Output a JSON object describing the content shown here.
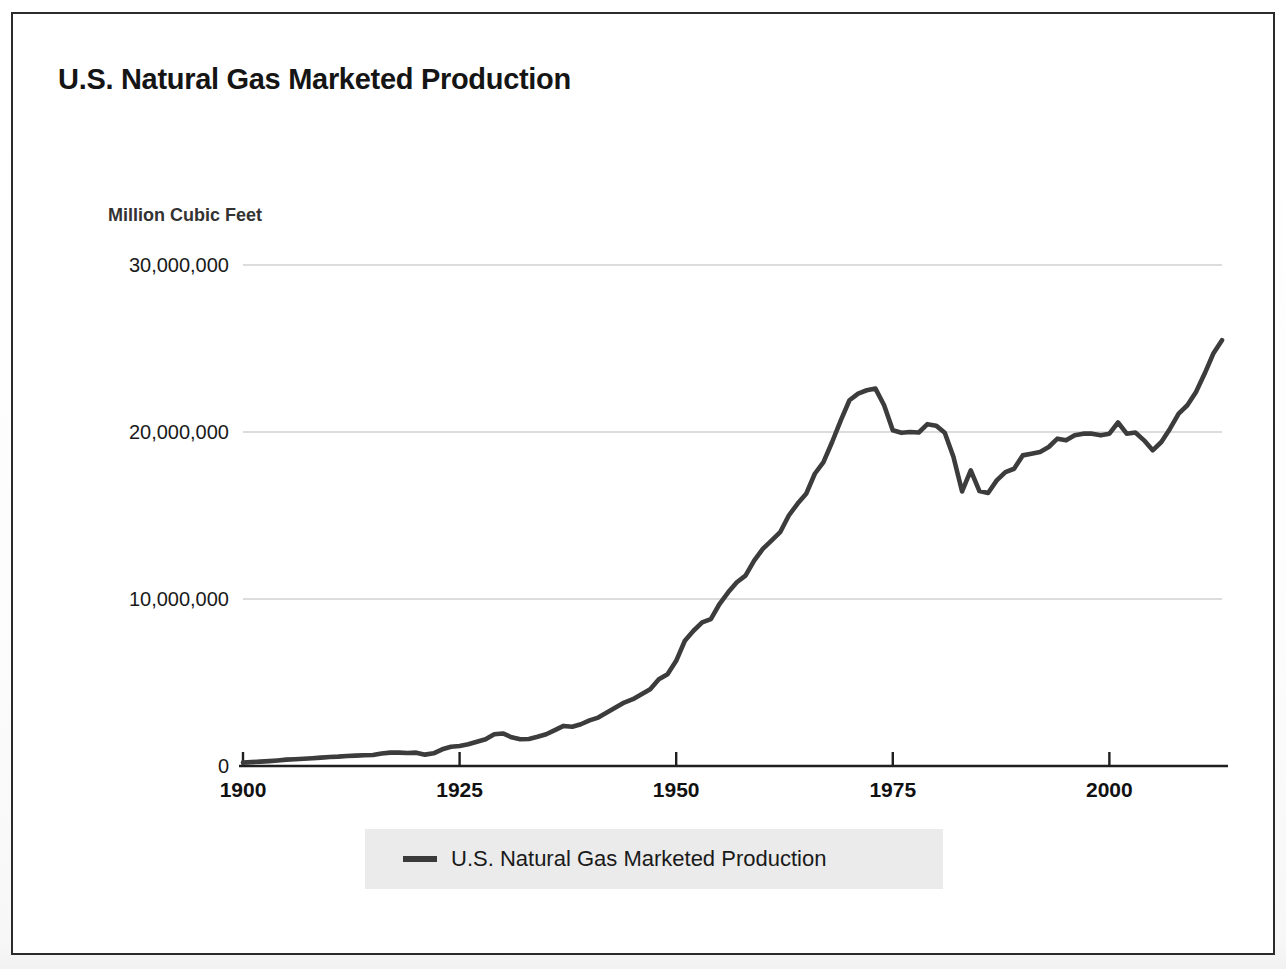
{
  "chart": {
    "title": "U.S. Natural Gas Marketed Production",
    "y_axis_title": "Million Cubic Feet",
    "legend_label": "U.S. Natural Gas Marketed Production",
    "series_color": "#3c3c3c",
    "legend_background": "#ebebeb",
    "frame_color": "#2b2b2b"
  },
  "chart_data": {
    "type": "line",
    "title": "U.S. Natural Gas Marketed Production",
    "xlabel": "",
    "ylabel": "Million Cubic Feet",
    "xlim": [
      1900,
      2013
    ],
    "ylim": [
      0,
      30000000
    ],
    "grid": true,
    "legend_position": "bottom",
    "x_tick_labels": [
      "1900",
      "1925",
      "1950",
      "1975",
      "2000"
    ],
    "x_ticks": [
      1900,
      1925,
      1950,
      1975,
      2000
    ],
    "y_tick_labels": [
      "0",
      "10,000,000",
      "20,000,000",
      "30,000,000"
    ],
    "y_ticks": [
      0,
      10000000,
      20000000,
      30000000
    ],
    "series": [
      {
        "name": "U.S. Natural Gas Marketed Production",
        "color": "#3c3c3c",
        "x": [
          1900,
          1901,
          1902,
          1903,
          1904,
          1905,
          1906,
          1907,
          1908,
          1909,
          1910,
          1911,
          1912,
          1913,
          1914,
          1915,
          1916,
          1917,
          1918,
          1919,
          1920,
          1921,
          1922,
          1923,
          1924,
          1925,
          1926,
          1927,
          1928,
          1929,
          1930,
          1931,
          1932,
          1933,
          1934,
          1935,
          1936,
          1937,
          1938,
          1939,
          1940,
          1941,
          1942,
          1943,
          1944,
          1945,
          1946,
          1947,
          1948,
          1949,
          1950,
          1951,
          1952,
          1953,
          1954,
          1955,
          1956,
          1957,
          1958,
          1959,
          1960,
          1961,
          1962,
          1963,
          1964,
          1965,
          1966,
          1967,
          1968,
          1969,
          1970,
          1971,
          1972,
          1973,
          1974,
          1975,
          1976,
          1977,
          1978,
          1979,
          1980,
          1981,
          1982,
          1983,
          1984,
          1985,
          1986,
          1987,
          1988,
          1989,
          1990,
          1991,
          1992,
          1993,
          1994,
          1995,
          1996,
          1997,
          1998,
          1999,
          2000,
          2001,
          2002,
          2003,
          2004,
          2005,
          2006,
          2007,
          2008,
          2009,
          2010,
          2011,
          2012,
          2013
        ],
        "values": [
          200000,
          230000,
          260000,
          290000,
          330000,
          380000,
          400000,
          430000,
          460000,
          500000,
          540000,
          560000,
          600000,
          620000,
          640000,
          660000,
          750000,
          800000,
          800000,
          780000,
          800000,
          680000,
          760000,
          1000000,
          1150000,
          1200000,
          1300000,
          1450000,
          1600000,
          1900000,
          1950000,
          1720000,
          1600000,
          1620000,
          1750000,
          1900000,
          2150000,
          2400000,
          2350000,
          2500000,
          2730000,
          2900000,
          3200000,
          3500000,
          3800000,
          4000000,
          4300000,
          4600000,
          5200000,
          5500000,
          6300000,
          7500000,
          8100000,
          8600000,
          8800000,
          9700000,
          10400000,
          11000000,
          11400000,
          12300000,
          13000000,
          13500000,
          14000000,
          15000000,
          15700000,
          16300000,
          17500000,
          18200000,
          19400000,
          20700000,
          21900000,
          22300000,
          22500000,
          22600000,
          21600000,
          20100000,
          19950000,
          20000000,
          19970000,
          20470000,
          20380000,
          19960000,
          18520000,
          16440000,
          17700000,
          16460000,
          16350000,
          17100000,
          17600000,
          17800000,
          18600000,
          18700000,
          18800000,
          19100000,
          19600000,
          19500000,
          19800000,
          19900000,
          19900000,
          19800000,
          19900000,
          20570000,
          19900000,
          19970000,
          19500000,
          18900000,
          19400000,
          20200000,
          21100000,
          21600000,
          22400000,
          23500000,
          24700000,
          25500000
        ]
      }
    ]
  }
}
